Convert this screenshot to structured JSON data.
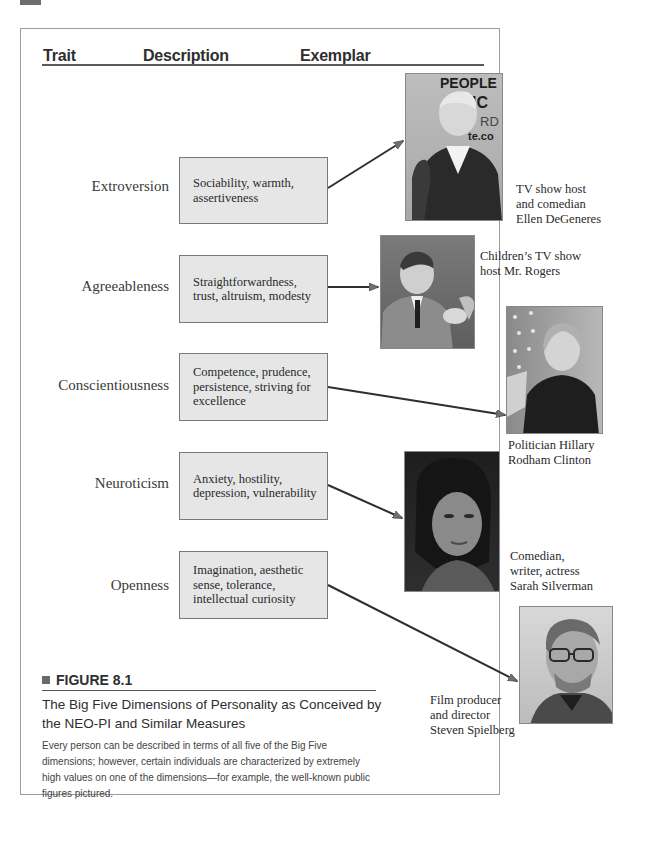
{
  "header": {
    "columns": [
      "Trait",
      "Description",
      "Exemplar"
    ]
  },
  "traits": [
    {
      "name": "Extroversion",
      "description": "Sociability, warmth, assertiveness",
      "exemplar_caption": "TV show host\nand comedian\nEllen DeGeneres",
      "photo": "portrait-ellen-degeneres"
    },
    {
      "name": "Agreeableness",
      "description": "Straightforwardness, trust, altruism, modesty",
      "exemplar_caption": "Children’s TV show\nhost Mr. Rogers",
      "photo": "portrait-mr-rogers"
    },
    {
      "name": "Conscientiousness",
      "description": "Competence, prudence, persistence, striving for excellence",
      "exemplar_caption": "Politician Hillary\nRodham Clinton",
      "photo": "portrait-hillary-clinton"
    },
    {
      "name": "Neuroticism",
      "description": "Anxiety, hostility, depression, vulnerability",
      "exemplar_caption": "Comedian,\nwriter, actress\nSarah Silverman",
      "photo": "portrait-sarah-silverman"
    },
    {
      "name": "Openness",
      "description": "Imagination, aesthetic sense, tolerance, intellectual curiosity",
      "exemplar_caption": "Film producer\nand director\nSteven Spielberg",
      "photo": "portrait-steven-spielberg"
    }
  ],
  "photo_text": {
    "ellen_backdrop": "PEOPLE\nCHOIC\nARD\nte.co"
  },
  "figure": {
    "label": "FIGURE 8.1",
    "title": "The Big Five Dimensions of Personality as Conceived by the NEO-PI and Similar Measures",
    "description": "Every person can be described in terms of all five of the Big Five dimensions; however, certain individuals are characterized by extremely high values on one of the dimensions—for example, the well-known public figures pictured."
  },
  "colors": {
    "box_fill": "#e6e6e6",
    "box_border": "#7a7a7a",
    "frame_border": "#9c9c9c",
    "arrow": "#2f2f2f",
    "arrow_head": "#707070"
  }
}
